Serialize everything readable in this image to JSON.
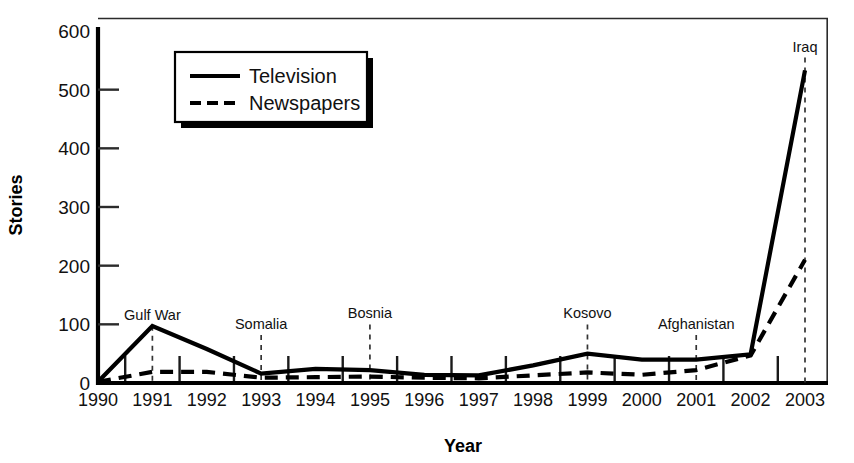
{
  "chart_data": {
    "type": "line",
    "title": "",
    "xlabel": "Year",
    "ylabel": "Stories",
    "x": [
      1990,
      1991,
      1992,
      1993,
      1994,
      1995,
      1996,
      1997,
      1998,
      1999,
      2000,
      2001,
      2002,
      2003
    ],
    "categories": [
      "1990",
      "1991",
      "1992",
      "1993",
      "1994",
      "1995",
      "1996",
      "1997",
      "1998",
      "1999",
      "2000",
      "2001",
      "2002",
      "2003"
    ],
    "series": [
      {
        "name": "Television",
        "style": "solid",
        "values": [
          2,
          97,
          58,
          16,
          24,
          22,
          14,
          13,
          30,
          50,
          40,
          40,
          49,
          533
        ]
      },
      {
        "name": "Newspapers",
        "style": "dashed",
        "values": [
          2,
          19,
          19,
          9,
          10,
          11,
          9,
          8,
          13,
          18,
          14,
          22,
          47,
          210
        ]
      }
    ],
    "ylim": [
      0,
      600
    ],
    "yticks": [
      0,
      100,
      200,
      300,
      400,
      500,
      600
    ],
    "ytick_labels": [
      "0",
      "100",
      "200",
      "300",
      "400",
      "500",
      "600"
    ],
    "grid": false,
    "legend_position": "upper-left-inset",
    "annotations": [
      {
        "label": "Gulf War",
        "x": 1991,
        "label_y": 108
      },
      {
        "label": "Somalia",
        "x": 1993,
        "label_y": 92
      },
      {
        "label": "Bosnia",
        "x": 1995,
        "label_y": 110
      },
      {
        "label": "Kosovo",
        "x": 1999,
        "label_y": 110
      },
      {
        "label": "Afghanistan",
        "x": 2001,
        "label_y": 92
      },
      {
        "label": "Iraq",
        "x": 2003,
        "label_y": 565
      }
    ]
  },
  "legend": {
    "items": [
      {
        "label": "Television",
        "style": "solid"
      },
      {
        "label": "Newspapers",
        "style": "dashed"
      }
    ]
  },
  "colors": {
    "ink": "#000000",
    "axis": "#1a1a1a",
    "background": "#ffffff"
  }
}
